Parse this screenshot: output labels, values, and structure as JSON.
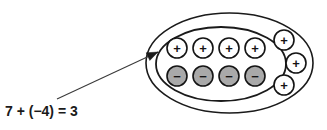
{
  "figure": {
    "equation": "7 + (−4) = 3"
  },
  "colors": {
    "background": "#ffffff",
    "outline": "#1a1a1a",
    "positive_fill": "#ffffff",
    "negative_fill": "#a9a9a9",
    "text": "#1a1a1a",
    "arrow": "#3a3a3a"
  },
  "groups": {
    "outer_ellipse": {
      "name": "outer-group-ellipse",
      "cx": 229.5,
      "cy": 63,
      "rx": 83.5,
      "ry": 50,
      "stroke_width": 1.6
    },
    "inner_ellipse": {
      "name": "zero-pair-ellipse",
      "cx": 221,
      "cy": 64,
      "rx": 65,
      "ry": 37,
      "stroke_width": 1.8
    }
  },
  "chips": {
    "radius": 10,
    "positive_label": "+",
    "negative_label": "−",
    "top_row_positive": [
      {
        "name": "chip-positive-1",
        "cx": 177,
        "cy": 48,
        "sign": "+"
      },
      {
        "name": "chip-positive-2",
        "cx": 203,
        "cy": 48,
        "sign": "+"
      },
      {
        "name": "chip-positive-3",
        "cx": 229,
        "cy": 48,
        "sign": "+"
      },
      {
        "name": "chip-positive-4",
        "cx": 255,
        "cy": 48,
        "sign": "+"
      }
    ],
    "bottom_row_negative": [
      {
        "name": "chip-negative-1",
        "cx": 177,
        "cy": 76,
        "sign": "−"
      },
      {
        "name": "chip-negative-2",
        "cx": 203,
        "cy": 76,
        "sign": "−"
      },
      {
        "name": "chip-negative-3",
        "cx": 229,
        "cy": 76,
        "sign": "−"
      },
      {
        "name": "chip-negative-4",
        "cx": 255,
        "cy": 76,
        "sign": "−"
      }
    ],
    "outside_positive": [
      {
        "name": "chip-positive-5",
        "cx": 284,
        "cy": 40,
        "sign": "+"
      },
      {
        "name": "chip-positive-6",
        "cx": 296,
        "cy": 63,
        "sign": "+"
      },
      {
        "name": "chip-positive-7",
        "cx": 284,
        "cy": 85,
        "sign": "+"
      }
    ]
  },
  "annotation": {
    "arrow": {
      "name": "zero-pair-pointer-arrow",
      "start_x": 57,
      "start_y": 99,
      "end_x": 158,
      "end_y": 52
    },
    "equation_position": {
      "x": 5,
      "y": 116
    }
  },
  "counts": {
    "positive_total": 7,
    "negative_total": 4,
    "zero_pairs": 4,
    "result": 3
  }
}
